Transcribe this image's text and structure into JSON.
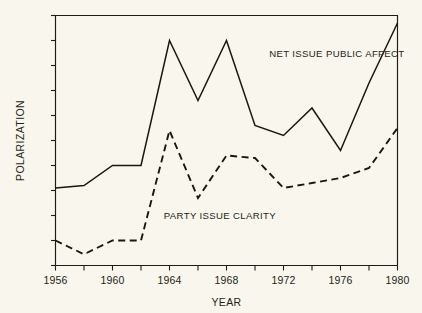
{
  "chart_data": {
    "type": "line",
    "title": "",
    "xlabel": "YEAR",
    "ylabel": "POLARIZATION",
    "grid": false,
    "legend_position": "inline-annotations",
    "xlim": [
      1956,
      1980
    ],
    "ylim": [
      0,
      10
    ],
    "x": [
      1956,
      1958,
      1960,
      1962,
      1964,
      1966,
      1968,
      1970,
      1972,
      1974,
      1976,
      1978,
      1980
    ],
    "xticks": [
      1956,
      1958,
      1960,
      1962,
      1964,
      1966,
      1968,
      1970,
      1972,
      1974,
      1976,
      1978,
      1980
    ],
    "xtick_labels": [
      "1956",
      "",
      "1960",
      "",
      "1964",
      "",
      "1968",
      "",
      "1972",
      "",
      "1976",
      "",
      "1980"
    ],
    "xtick_labels_shown": [
      "1956",
      "1960",
      "1964",
      "1968",
      "1972",
      "1976",
      "1980"
    ],
    "ytick_count": 11,
    "ytick_labels": [
      "",
      "",
      "",
      "",
      "",
      "",
      "",
      "",
      "",
      "",
      ""
    ],
    "series": [
      {
        "name": "NET ISSUE PUBLIC AFFECT",
        "style": "solid",
        "color": "#19180f",
        "values": [
          3.1,
          3.2,
          4.0,
          4.0,
          9.0,
          6.6,
          9.0,
          5.6,
          5.2,
          6.3,
          4.6,
          7.3,
          9.7
        ]
      },
      {
        "name": "PARTY ISSUE CLARITY",
        "style": "dashed",
        "color": "#19180f",
        "values": [
          1.0,
          0.45,
          1.0,
          1.0,
          5.4,
          2.7,
          4.4,
          4.3,
          3.1,
          3.3,
          3.5,
          3.9,
          5.5
        ]
      }
    ],
    "annotations": [
      {
        "text": "NET ISSUE PUBLIC AFFECT",
        "x": 1971.0,
        "y": 8.35
      },
      {
        "text": "PARTY ISSUE CLARITY",
        "x": 1963.6,
        "y": 1.85
      }
    ]
  },
  "axis": {
    "x_title": "YEAR",
    "y_title": "POLARIZATION"
  },
  "labels": {
    "net_issue": "NET ISSUE PUBLIC AFFECT",
    "party_clarity": "PARTY ISSUE CLARITY"
  },
  "colors": {
    "background": "#f8f6ed",
    "ink": "#19180f",
    "frame": "#1d1d18"
  }
}
